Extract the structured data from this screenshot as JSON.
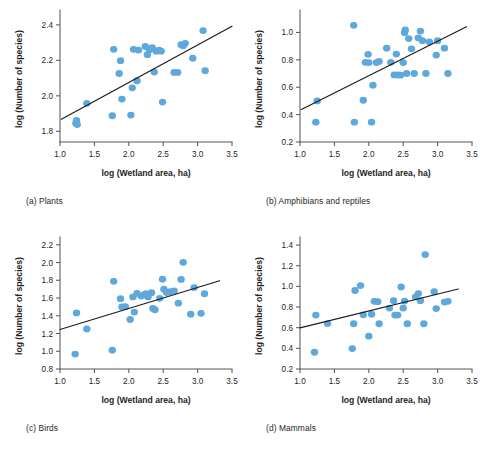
{
  "figure": {
    "background": "#ffffff",
    "marker_color": "#5fa8dc",
    "line_color": "#1a1a1a",
    "axis_color": "#58595b",
    "panel_count": 4
  },
  "panels": [
    {
      "key": "a",
      "caption": "(a) Plants",
      "xlabel": "log (Wetland area, ha)",
      "ylabel": "log (Number of species)",
      "xticks": [
        "1.0",
        "1.5",
        "2.0",
        "2.5",
        "3.0",
        "3.5"
      ],
      "yticks": [
        "1.8",
        "2.0",
        "2.2",
        "2.4"
      ]
    },
    {
      "key": "b",
      "caption": "(b) Amphibians and reptiles",
      "xlabel": "log (Wetland area, ha)",
      "ylabel": "log (Number of species)",
      "xticks": [
        "1.0",
        "1.5",
        "2.0",
        "2.5",
        "3.0",
        "3.5"
      ],
      "yticks": [
        "0.2",
        "0.4",
        "0.6",
        "0.8",
        "1.0"
      ]
    },
    {
      "key": "c",
      "caption": "(c) Birds",
      "xlabel": "log (Wetland area, ha)",
      "ylabel": "log (Number of species)",
      "xticks": [
        "1.0",
        "1.5",
        "2.0",
        "2.5",
        "3.0",
        "3.5"
      ],
      "yticks": [
        "0.8",
        "1.0",
        "1.2",
        "1.4",
        "1.6",
        "1.8",
        "2.0",
        "2.2"
      ]
    },
    {
      "key": "d",
      "caption": "(d) Mammals",
      "xlabel": "log (Wetland area, ha)",
      "ylabel": "log (Number of species)",
      "xticks": [
        "1.0",
        "1.5",
        "2.0",
        "2.5",
        "3.0",
        "3.5"
      ],
      "yticks": [
        "0.2",
        "0.4",
        "0.6",
        "0.8",
        "1.0",
        "1.2",
        "1.4"
      ]
    }
  ],
  "chart_data": [
    {
      "type": "scatter",
      "panel": "a",
      "title": "(a) Plants",
      "xlabel": "log (Wetland area, ha)",
      "ylabel": "log (Number of species)",
      "xlim": [
        1.0,
        3.5
      ],
      "ylim": [
        1.74,
        2.45
      ],
      "xticks": [
        1.0,
        1.5,
        2.0,
        2.5,
        3.0,
        3.5
      ],
      "yticks": [
        1.8,
        2.0,
        2.2,
        2.4
      ],
      "grid": false,
      "legend": "none",
      "trendline": {
        "x": [
          1.02,
          3.5
        ],
        "y": [
          1.868,
          2.392
        ]
      },
      "points": [
        {
          "x": 1.23,
          "y": 1.845
        },
        {
          "x": 1.25,
          "y": 1.838
        },
        {
          "x": 1.24,
          "y": 1.862
        },
        {
          "x": 1.39,
          "y": 1.958
        },
        {
          "x": 1.76,
          "y": 1.888
        },
        {
          "x": 1.78,
          "y": 2.262
        },
        {
          "x": 1.86,
          "y": 2.126
        },
        {
          "x": 1.88,
          "y": 2.198
        },
        {
          "x": 1.9,
          "y": 1.982
        },
        {
          "x": 2.03,
          "y": 1.892
        },
        {
          "x": 2.05,
          "y": 2.045
        },
        {
          "x": 2.07,
          "y": 2.262
        },
        {
          "x": 2.12,
          "y": 2.085
        },
        {
          "x": 2.14,
          "y": 2.258
        },
        {
          "x": 2.24,
          "y": 2.278
        },
        {
          "x": 2.27,
          "y": 2.232
        },
        {
          "x": 2.3,
          "y": 2.258
        },
        {
          "x": 2.34,
          "y": 2.272
        },
        {
          "x": 2.37,
          "y": 2.134
        },
        {
          "x": 2.4,
          "y": 2.252
        },
        {
          "x": 2.44,
          "y": 2.258
        },
        {
          "x": 2.47,
          "y": 2.252
        },
        {
          "x": 2.49,
          "y": 1.965
        },
        {
          "x": 2.66,
          "y": 2.132
        },
        {
          "x": 2.71,
          "y": 2.132
        },
        {
          "x": 2.76,
          "y": 2.288
        },
        {
          "x": 2.79,
          "y": 2.282
        },
        {
          "x": 2.82,
          "y": 2.296
        },
        {
          "x": 2.93,
          "y": 2.212
        },
        {
          "x": 3.08,
          "y": 2.368
        },
        {
          "x": 3.11,
          "y": 2.142
        }
      ]
    },
    {
      "type": "scatter",
      "panel": "b",
      "title": "(b) Amphibians and reptiles",
      "xlabel": "log (Wetland area, ha)",
      "ylabel": "log (Number of species)",
      "xlim": [
        1.0,
        3.5
      ],
      "ylim": [
        0.2,
        1.12
      ],
      "xticks": [
        1.0,
        1.5,
        2.0,
        2.5,
        3.0,
        3.5
      ],
      "yticks": [
        0.2,
        0.4,
        0.6,
        0.8,
        1.0
      ],
      "grid": false,
      "legend": "none",
      "trendline": {
        "x": [
          1.02,
          3.42
        ],
        "y": [
          0.438,
          1.042
        ]
      },
      "points": [
        {
          "x": 1.23,
          "y": 0.345
        },
        {
          "x": 1.25,
          "y": 0.5
        },
        {
          "x": 1.78,
          "y": 1.052
        },
        {
          "x": 1.79,
          "y": 0.345
        },
        {
          "x": 1.92,
          "y": 0.505
        },
        {
          "x": 1.95,
          "y": 0.782
        },
        {
          "x": 1.99,
          "y": 0.84
        },
        {
          "x": 2.0,
          "y": 0.78
        },
        {
          "x": 2.04,
          "y": 0.345
        },
        {
          "x": 2.06,
          "y": 0.615
        },
        {
          "x": 2.11,
          "y": 0.78
        },
        {
          "x": 2.15,
          "y": 0.788
        },
        {
          "x": 2.26,
          "y": 0.885
        },
        {
          "x": 2.32,
          "y": 0.782
        },
        {
          "x": 2.37,
          "y": 0.69
        },
        {
          "x": 2.4,
          "y": 0.842
        },
        {
          "x": 2.42,
          "y": 0.69
        },
        {
          "x": 2.46,
          "y": 0.688
        },
        {
          "x": 2.5,
          "y": 0.78
        },
        {
          "x": 2.52,
          "y": 0.998
        },
        {
          "x": 2.53,
          "y": 1.018
        },
        {
          "x": 2.55,
          "y": 0.7
        },
        {
          "x": 2.58,
          "y": 0.955
        },
        {
          "x": 2.62,
          "y": 0.88
        },
        {
          "x": 2.66,
          "y": 0.7
        },
        {
          "x": 2.72,
          "y": 0.96
        },
        {
          "x": 2.75,
          "y": 1.01
        },
        {
          "x": 2.78,
          "y": 0.94
        },
        {
          "x": 2.83,
          "y": 0.7
        },
        {
          "x": 2.88,
          "y": 0.93
        },
        {
          "x": 2.98,
          "y": 0.835
        },
        {
          "x": 3.0,
          "y": 0.94
        },
        {
          "x": 3.1,
          "y": 0.885
        },
        {
          "x": 3.15,
          "y": 0.7
        }
      ]
    },
    {
      "type": "scatter",
      "panel": "c",
      "title": "(c) Birds",
      "xlabel": "log (Wetland area, ha)",
      "ylabel": "log (Number of species)",
      "xlim": [
        1.0,
        3.5
      ],
      "ylim": [
        0.8,
        2.22
      ],
      "xticks": [
        1.0,
        1.5,
        2.0,
        2.5,
        3.0,
        3.5
      ],
      "yticks": [
        0.8,
        1.0,
        1.2,
        1.4,
        1.6,
        1.8,
        2.0,
        2.2
      ],
      "grid": false,
      "legend": "none",
      "trendline": {
        "x": [
          1.0,
          3.32
        ],
        "y": [
          1.245,
          1.795
        ]
      },
      "points": [
        {
          "x": 1.22,
          "y": 0.968
        },
        {
          "x": 1.24,
          "y": 1.432
        },
        {
          "x": 1.39,
          "y": 1.252
        },
        {
          "x": 1.76,
          "y": 1.012
        },
        {
          "x": 1.78,
          "y": 1.788
        },
        {
          "x": 1.88,
          "y": 1.592
        },
        {
          "x": 1.9,
          "y": 1.5
        },
        {
          "x": 1.95,
          "y": 1.502
        },
        {
          "x": 2.02,
          "y": 1.358
        },
        {
          "x": 2.06,
          "y": 1.612
        },
        {
          "x": 2.08,
          "y": 1.442
        },
        {
          "x": 2.12,
          "y": 1.652
        },
        {
          "x": 2.18,
          "y": 1.622
        },
        {
          "x": 2.22,
          "y": 1.635
        },
        {
          "x": 2.25,
          "y": 1.648
        },
        {
          "x": 2.28,
          "y": 1.612
        },
        {
          "x": 2.33,
          "y": 1.66
        },
        {
          "x": 2.35,
          "y": 1.482
        },
        {
          "x": 2.38,
          "y": 1.468
        },
        {
          "x": 2.45,
          "y": 1.596
        },
        {
          "x": 2.49,
          "y": 1.812
        },
        {
          "x": 2.51,
          "y": 1.7
        },
        {
          "x": 2.55,
          "y": 1.662
        },
        {
          "x": 2.6,
          "y": 1.672
        },
        {
          "x": 2.66,
          "y": 1.68
        },
        {
          "x": 2.72,
          "y": 1.542
        },
        {
          "x": 2.76,
          "y": 1.81
        },
        {
          "x": 2.79,
          "y": 2.002
        },
        {
          "x": 2.9,
          "y": 1.418
        },
        {
          "x": 2.95,
          "y": 1.718
        },
        {
          "x": 3.05,
          "y": 1.428
        },
        {
          "x": 3.1,
          "y": 1.648
        }
      ]
    },
    {
      "type": "scatter",
      "panel": "d",
      "title": "(d) Mammals",
      "xlabel": "log (Wetland area, ha)",
      "ylabel": "log (Number of species)",
      "xlim": [
        1.0,
        3.5
      ],
      "ylim": [
        0.2,
        1.42
      ],
      "xticks": [
        1.0,
        1.5,
        2.0,
        2.5,
        3.0,
        3.5
      ],
      "yticks": [
        0.2,
        0.4,
        0.6,
        0.8,
        1.0,
        1.2,
        1.4
      ],
      "grid": false,
      "legend": "none",
      "trendline": {
        "x": [
          1.0,
          3.3
        ],
        "y": [
          0.598,
          0.975
        ]
      },
      "points": [
        {
          "x": 1.21,
          "y": 0.362
        },
        {
          "x": 1.23,
          "y": 0.722
        },
        {
          "x": 1.4,
          "y": 0.64
        },
        {
          "x": 1.76,
          "y": 0.398
        },
        {
          "x": 1.78,
          "y": 0.638
        },
        {
          "x": 1.8,
          "y": 0.96
        },
        {
          "x": 1.88,
          "y": 1.008
        },
        {
          "x": 1.92,
          "y": 0.725
        },
        {
          "x": 2.0,
          "y": 0.518
        },
        {
          "x": 2.04,
          "y": 0.73
        },
        {
          "x": 2.08,
          "y": 0.855
        },
        {
          "x": 2.13,
          "y": 0.852
        },
        {
          "x": 2.15,
          "y": 0.638
        },
        {
          "x": 2.3,
          "y": 0.79
        },
        {
          "x": 2.36,
          "y": 0.862
        },
        {
          "x": 2.38,
          "y": 0.722
        },
        {
          "x": 2.42,
          "y": 0.722
        },
        {
          "x": 2.47,
          "y": 0.995
        },
        {
          "x": 2.5,
          "y": 0.79
        },
        {
          "x": 2.52,
          "y": 0.858
        },
        {
          "x": 2.56,
          "y": 0.638
        },
        {
          "x": 2.68,
          "y": 0.898
        },
        {
          "x": 2.72,
          "y": 0.93
        },
        {
          "x": 2.75,
          "y": 0.862
        },
        {
          "x": 2.8,
          "y": 0.638
        },
        {
          "x": 2.82,
          "y": 1.308
        },
        {
          "x": 2.95,
          "y": 0.948
        },
        {
          "x": 2.98,
          "y": 0.785
        },
        {
          "x": 3.1,
          "y": 0.848
        },
        {
          "x": 3.15,
          "y": 0.855
        }
      ]
    }
  ]
}
